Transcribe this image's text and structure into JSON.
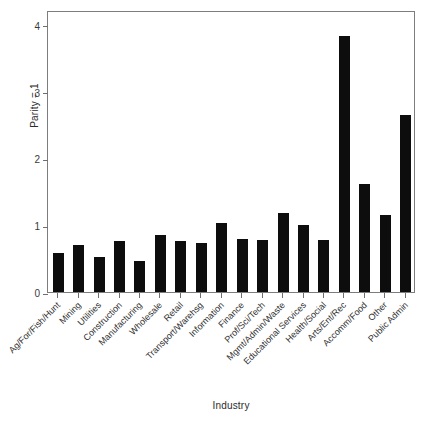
{
  "chart_data": {
    "type": "bar",
    "title": "",
    "xlabel": "Industry",
    "ylabel": "Parity = 1",
    "categories": [
      "Ag/For/Fish/Hunt",
      "Mining",
      "Utilities",
      "Construction",
      "Manufacturing",
      "Wholesale",
      "Retail",
      "Transport/Warehsg",
      "Information",
      "Finance",
      "Prof/Sci/Tech",
      "Mgmt/Admin/Waste",
      "Educational Services",
      "Health/Social",
      "Arts/Ent/Rec",
      "Accomm/Food",
      "Other",
      "Public Admin"
    ],
    "values": [
      0.58,
      0.7,
      0.52,
      0.76,
      0.47,
      0.85,
      0.77,
      0.74,
      1.03,
      0.8,
      0.78,
      1.18,
      1.0,
      0.78,
      3.83,
      1.61,
      1.15,
      2.65
    ],
    "ylim": [
      0,
      4.22
    ],
    "yticks": [
      0,
      1,
      2,
      3,
      4
    ],
    "ytick_labels": [
      "0",
      "1",
      "2",
      "3",
      "4"
    ],
    "grid": false,
    "legend": false,
    "legend_position": "none",
    "bar_color": "#0d0d0d",
    "axis_color": "#7d7d7d",
    "background_color": "#ffffff"
  }
}
